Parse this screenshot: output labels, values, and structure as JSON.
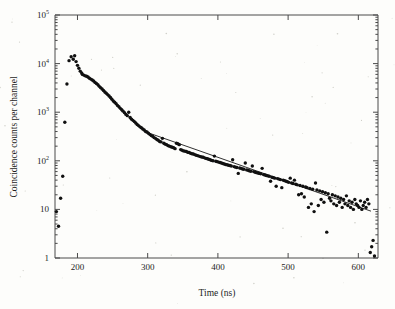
{
  "figure": {
    "background_color": "#fdfdfb",
    "ink_color": "#101010",
    "axis_color": "#4a4a4a"
  },
  "chart_data": {
    "type": "scatter",
    "title": "",
    "subtitle": "",
    "xlabel": "Time (ns)",
    "ylabel": "Coincidence counts per channel",
    "yscale": "log",
    "xscale": "linear",
    "xlim": [
      168,
      628
    ],
    "ylim": [
      1,
      100000
    ],
    "xticks": [
      200,
      300,
      400,
      500,
      600
    ],
    "xticklabels": [
      "200",
      "300",
      "400",
      "500",
      "600"
    ],
    "yticks": [
      1,
      10,
      100,
      1000,
      10000,
      100000
    ],
    "yticklabels": [
      "1",
      "10",
      "10^2",
      "10^3",
      "10^4",
      "10^5"
    ],
    "grid": false,
    "legend": null,
    "annotations": [],
    "series": [
      {
        "name": "Coincidence counts",
        "marker": "filled-circle",
        "marker_size": 1.7,
        "color": "#101010",
        "points": [
          [
            170,
            9
          ],
          [
            173,
            4.5
          ],
          [
            176,
            17
          ],
          [
            179,
            48
          ],
          [
            182,
            620
          ],
          [
            185,
            3800
          ],
          [
            188,
            11500
          ],
          [
            191,
            13800
          ],
          [
            194,
            12300
          ],
          [
            196,
            14500
          ],
          [
            198,
            11000
          ],
          [
            200,
            9200
          ],
          [
            202,
            8000
          ],
          [
            204,
            7000
          ],
          [
            206,
            6400
          ],
          [
            207,
            6000
          ],
          [
            209,
            5800
          ],
          [
            211,
            5600
          ],
          [
            213,
            5500
          ],
          [
            215,
            5300
          ],
          [
            217,
            5000
          ],
          [
            219,
            4800
          ],
          [
            221,
            4600
          ],
          [
            223,
            4400
          ],
          [
            225,
            4100
          ],
          [
            227,
            3900
          ],
          [
            229,
            3700
          ],
          [
            231,
            3400
          ],
          [
            233,
            3200
          ],
          [
            235,
            3000
          ],
          [
            237,
            2800
          ],
          [
            239,
            2600
          ],
          [
            241,
            2450
          ],
          [
            243,
            2300
          ],
          [
            245,
            2150
          ],
          [
            247,
            2000
          ],
          [
            249,
            1850
          ],
          [
            251,
            1700
          ],
          [
            253,
            1600
          ],
          [
            255,
            1500
          ],
          [
            257,
            1380
          ],
          [
            259,
            1300
          ],
          [
            261,
            1200
          ],
          [
            263,
            1120
          ],
          [
            265,
            1050
          ],
          [
            267,
            980
          ],
          [
            269,
            900
          ],
          [
            271,
            850
          ],
          [
            273,
            1000
          ],
          [
            275,
            780
          ],
          [
            277,
            720
          ],
          [
            279,
            680
          ],
          [
            281,
            640
          ],
          [
            283,
            600
          ],
          [
            285,
            560
          ],
          [
            287,
            530
          ],
          [
            289,
            500
          ],
          [
            291,
            480
          ],
          [
            293,
            450
          ],
          [
            295,
            430
          ],
          [
            297,
            400
          ],
          [
            299,
            390
          ],
          [
            301,
            370
          ],
          [
            303,
            350
          ],
          [
            305,
            330
          ],
          [
            307,
            320
          ],
          [
            309,
            300
          ],
          [
            311,
            290
          ],
          [
            313,
            275
          ],
          [
            315,
            265
          ],
          [
            317,
            250
          ],
          [
            319,
            245
          ],
          [
            321,
            290
          ],
          [
            323,
            230
          ],
          [
            325,
            220
          ],
          [
            327,
            215
          ],
          [
            329,
            205
          ],
          [
            331,
            200
          ],
          [
            333,
            195
          ],
          [
            335,
            190
          ],
          [
            337,
            185
          ],
          [
            339,
            178
          ],
          [
            341,
            230
          ],
          [
            343,
            225
          ],
          [
            345,
            215
          ],
          [
            347,
            170
          ],
          [
            349,
            165
          ],
          [
            351,
            160
          ],
          [
            353,
            158
          ],
          [
            355,
            155
          ],
          [
            357,
            150
          ],
          [
            359,
            148
          ],
          [
            361,
            143
          ],
          [
            363,
            140
          ],
          [
            365,
            138
          ],
          [
            367,
            134
          ],
          [
            369,
            130
          ],
          [
            371,
            128
          ],
          [
            373,
            125
          ],
          [
            375,
            122
          ],
          [
            377,
            120
          ],
          [
            379,
            118
          ],
          [
            381,
            115
          ],
          [
            383,
            112
          ],
          [
            385,
            110
          ],
          [
            387,
            108
          ],
          [
            389,
            105
          ],
          [
            391,
            102
          ],
          [
            393,
            100
          ],
          [
            395,
            125
          ],
          [
            397,
            98
          ],
          [
            399,
            96
          ],
          [
            401,
            94
          ],
          [
            403,
            92
          ],
          [
            405,
            90
          ],
          [
            407,
            88
          ],
          [
            409,
            86
          ],
          [
            411,
            84
          ],
          [
            413,
            83
          ],
          [
            415,
            81
          ],
          [
            417,
            80
          ],
          [
            419,
            78
          ],
          [
            421,
            105
          ],
          [
            423,
            76
          ],
          [
            425,
            74
          ],
          [
            427,
            73
          ],
          [
            429,
            55
          ],
          [
            431,
            71
          ],
          [
            433,
            70
          ],
          [
            435,
            68
          ],
          [
            437,
            67
          ],
          [
            439,
            90
          ],
          [
            441,
            65
          ],
          [
            443,
            64
          ],
          [
            445,
            62
          ],
          [
            447,
            61
          ],
          [
            449,
            78
          ],
          [
            451,
            60
          ],
          [
            453,
            58
          ],
          [
            455,
            57
          ],
          [
            457,
            56
          ],
          [
            459,
            55
          ],
          [
            461,
            54
          ],
          [
            463,
            70
          ],
          [
            465,
            52
          ],
          [
            467,
            51
          ],
          [
            469,
            50
          ],
          [
            471,
            49
          ],
          [
            473,
            48
          ],
          [
            475,
            38
          ],
          [
            477,
            46
          ],
          [
            479,
            45
          ],
          [
            481,
            44
          ],
          [
            483,
            30
          ],
          [
            485,
            43
          ],
          [
            487,
            42
          ],
          [
            489,
            41
          ],
          [
            491,
            28
          ],
          [
            493,
            40
          ],
          [
            495,
            39
          ],
          [
            497,
            38
          ],
          [
            499,
            37
          ],
          [
            501,
            36
          ],
          [
            503,
            44
          ],
          [
            505,
            35
          ],
          [
            507,
            34
          ],
          [
            509,
            40
          ],
          [
            511,
            33
          ],
          [
            513,
            32
          ],
          [
            515,
            20
          ],
          [
            517,
            31
          ],
          [
            519,
            21
          ],
          [
            521,
            30
          ],
          [
            523,
            18
          ],
          [
            525,
            29
          ],
          [
            527,
            28
          ],
          [
            529,
            11
          ],
          [
            531,
            27
          ],
          [
            533,
            13
          ],
          [
            535,
            26
          ],
          [
            537,
            9
          ],
          [
            539,
            35
          ],
          [
            541,
            25
          ],
          [
            543,
            12
          ],
          [
            545,
            24
          ],
          [
            547,
            16
          ],
          [
            549,
            23
          ],
          [
            551,
            14
          ],
          [
            553,
            22
          ],
          [
            555,
            3.4
          ],
          [
            557,
            21
          ],
          [
            559,
            17
          ],
          [
            561,
            15
          ],
          [
            563,
            20
          ],
          [
            565,
            13
          ],
          [
            567,
            19
          ],
          [
            569,
            12
          ],
          [
            571,
            18
          ],
          [
            573,
            14
          ],
          [
            575,
            17
          ],
          [
            577,
            11
          ],
          [
            579,
            16
          ],
          [
            581,
            13
          ],
          [
            583,
            19
          ],
          [
            585,
            12
          ],
          [
            587,
            15
          ],
          [
            589,
            11
          ],
          [
            591,
            14
          ],
          [
            593,
            10
          ],
          [
            595,
            16
          ],
          [
            597,
            13
          ],
          [
            599,
            12
          ],
          [
            601,
            11
          ],
          [
            603,
            15
          ],
          [
            605,
            10
          ],
          [
            607,
            12
          ],
          [
            609,
            14
          ],
          [
            611,
            11
          ],
          [
            613,
            16
          ],
          [
            615,
            13
          ],
          [
            617,
            1.3
          ],
          [
            619,
            1.7
          ],
          [
            621,
            2.3
          ],
          [
            623,
            1.1
          ]
        ]
      }
    ],
    "fit": {
      "name": "exponential fit",
      "color": "#1a1a1a",
      "x_start": 300,
      "x_end": 618,
      "y_start": 380,
      "y_end": 9.2
    }
  }
}
